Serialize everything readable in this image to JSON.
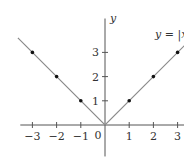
{
  "chart_data": {
    "type": "line",
    "title": "",
    "xlabel": "",
    "ylabel": "y",
    "xlim": [
      -3.5,
      3.3
    ],
    "ylim": [
      -1.3,
      4.4
    ],
    "grid": false,
    "x_ticks": [
      -3,
      -2,
      -1,
      1,
      2,
      3
    ],
    "x_tick_labels": [
      "−3",
      "−2",
      "−1",
      "1",
      "2",
      "3"
    ],
    "y_ticks": [
      1,
      2,
      3
    ],
    "y_tick_labels": [
      "1",
      "2",
      "3"
    ],
    "origin_label": "0",
    "series": [
      {
        "name": "y = |x",
        "function": "abs",
        "line_x": [
          -3.6,
          0,
          3.3
        ],
        "line_y": [
          3.6,
          0,
          3.3
        ],
        "color": "#8a8a8a"
      }
    ],
    "points": {
      "x": [
        -3,
        -2,
        -1,
        1,
        2,
        3
      ],
      "y": [
        3,
        2,
        1,
        1,
        2,
        3
      ],
      "color": "#111111"
    },
    "annotation": "y = |x"
  }
}
